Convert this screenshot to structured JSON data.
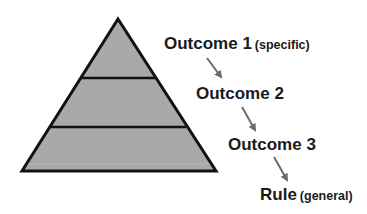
{
  "diagram": {
    "type": "pyramid-with-steps",
    "pyramid": {
      "levels": 3,
      "fill_color": "#a9a9a9",
      "stroke_color": "#111111"
    },
    "steps": [
      {
        "label": "Outcome 1",
        "qualifier": "(specific)"
      },
      {
        "label": "Outcome 2",
        "qualifier": ""
      },
      {
        "label": "Outcome 3",
        "qualifier": ""
      },
      {
        "label": "Rule",
        "qualifier": "(general)"
      }
    ],
    "arrow_color": "#6b6b6b"
  }
}
